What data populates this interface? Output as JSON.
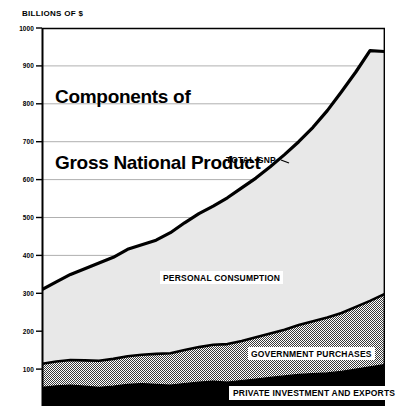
{
  "chart_data": {
    "type": "area",
    "stacked": true,
    "title": "Components of\nGross National Product",
    "title_line1": "Components of",
    "title_line2": "Gross National Product",
    "ylabel": "BILLIONS OF $",
    "xlabel": "",
    "ylim": [
      0,
      1000
    ],
    "grid": true,
    "grid_interval": 100,
    "ytick_labels": [
      "1000",
      "900",
      "800",
      "700",
      "600",
      "500",
      "400",
      "300",
      "200",
      "100"
    ],
    "ytick_values": [
      1000,
      900,
      800,
      700,
      600,
      500,
      400,
      300,
      200,
      100
    ],
    "legend_position": "inline-annotations",
    "annotations": [
      {
        "text": "TOTAL GNP",
        "style": "plain",
        "points_to": "top-line"
      },
      {
        "text": "PERSONAL CONSUMPTION",
        "style": "boxed",
        "points_to": "middle-band"
      },
      {
        "text": "GOVERNMENT PURCHASES",
        "style": "boxed",
        "points_to": "checkered-band"
      },
      {
        "text": "PRIVATE INVESTMENT AND EXPORTS",
        "style": "boxed",
        "points_to": "black-band"
      }
    ],
    "x": [
      0,
      1,
      2,
      3,
      4,
      5,
      6,
      7,
      8,
      9,
      10,
      11,
      12,
      13,
      14,
      15,
      16,
      17,
      18,
      19,
      20,
      21,
      22,
      23,
      24
    ],
    "series": [
      {
        "name": "PRIVATE INVESTMENT AND EXPORTS",
        "fill": "#000000",
        "values": [
          52,
          56,
          58,
          55,
          52,
          55,
          60,
          62,
          60,
          58,
          62,
          66,
          68,
          66,
          70,
          74,
          78,
          82,
          86,
          88,
          90,
          94,
          100,
          106,
          112
        ]
      },
      {
        "name": "GOVERNMENT PURCHASES",
        "fill": "#9a9a9a",
        "pattern": "checkered",
        "values": [
          62,
          64,
          66,
          68,
          70,
          72,
          74,
          76,
          80,
          84,
          88,
          92,
          96,
          100,
          104,
          110,
          116,
          122,
          130,
          138,
          146,
          154,
          164,
          174,
          186
        ]
      },
      {
        "name": "PERSONAL CONSUMPTION",
        "fill": "#e8e8e8",
        "values": [
          196,
          210,
          226,
          242,
          258,
          268,
          282,
          290,
          300,
          318,
          336,
          352,
          366,
          386,
          404,
          420,
          440,
          462,
          484,
          512,
          546,
          584,
          620,
          660,
          640
        ]
      }
    ],
    "total_line": {
      "name": "TOTAL GNP",
      "color": "#000000",
      "values": [
        310,
        330,
        350,
        365,
        380,
        395,
        416,
        428,
        440,
        460,
        486,
        510,
        530,
        552,
        578,
        604,
        634,
        666,
        700,
        738,
        782,
        832,
        884,
        940,
        938
      ]
    }
  }
}
